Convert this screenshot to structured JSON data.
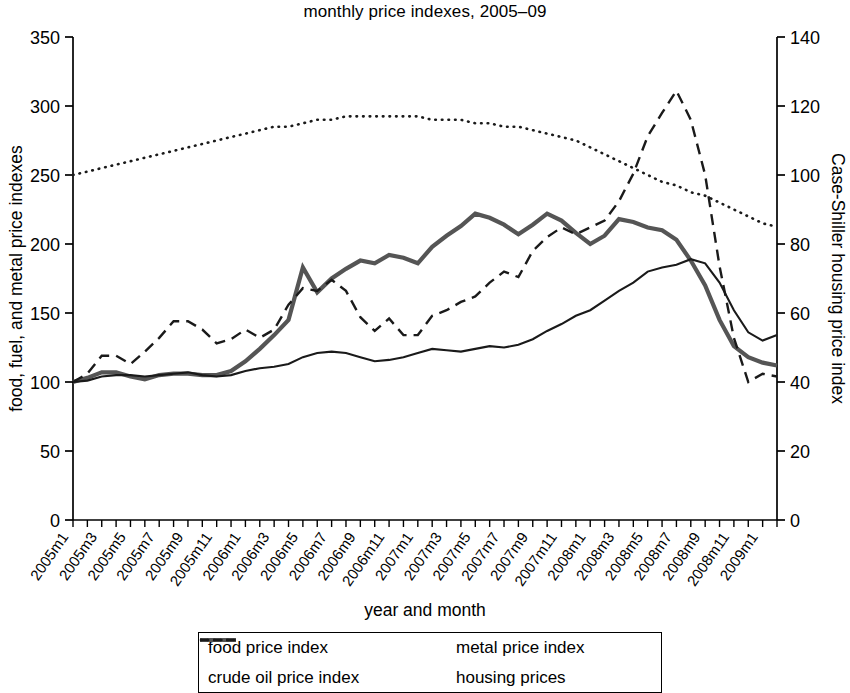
{
  "chart_data": {
    "type": "line",
    "title": "monthly price indexes, 2005–09",
    "xlabel": "year and month",
    "ylabel": "food, fuel, and metal price indexes",
    "y2label": "Case-Shiller housing price index",
    "ylim": [
      0,
      350
    ],
    "yticks": [
      0,
      50,
      100,
      150,
      200,
      250,
      300,
      350
    ],
    "y2lim": [
      0,
      140
    ],
    "y2ticks": [
      0,
      20,
      40,
      60,
      80,
      100,
      120,
      140
    ],
    "grid": false,
    "legend_position": "bottom",
    "x": [
      "2005m1",
      "2005m2",
      "2005m3",
      "2005m4",
      "2005m5",
      "2005m6",
      "2005m7",
      "2005m8",
      "2005m9",
      "2005m10",
      "2005m11",
      "2005m12",
      "2006m1",
      "2006m2",
      "2006m3",
      "2006m4",
      "2006m5",
      "2006m6",
      "2006m7",
      "2006m8",
      "2006m9",
      "2006m10",
      "2006m11",
      "2006m12",
      "2007m1",
      "2007m2",
      "2007m3",
      "2007m4",
      "2007m5",
      "2007m6",
      "2007m7",
      "2007m8",
      "2007m9",
      "2007m10",
      "2007m11",
      "2007m12",
      "2008m1",
      "2008m2",
      "2008m3",
      "2008m4",
      "2008m5",
      "2008m6",
      "2008m7",
      "2008m8",
      "2008m9",
      "2008m10",
      "2008m11",
      "2008m12",
      "2009m1",
      "2009m2"
    ],
    "xtick_labels": [
      "2005m1",
      "2005m3",
      "2005m5",
      "2005m7",
      "2005m9",
      "2005m11",
      "2006m1",
      "2006m3",
      "2006m5",
      "2006m7",
      "2006m9",
      "2006m11",
      "2007m1",
      "2007m3",
      "2007m5",
      "2007m7",
      "2007m9",
      "2007m11",
      "2008m1",
      "2008m3",
      "2008m5",
      "2008m7",
      "2008m9",
      "2008m11",
      "2009m1"
    ],
    "series": [
      {
        "name": "food price index",
        "axis": "left",
        "style": "solid",
        "values": [
          100,
          101,
          104,
          105,
          105,
          104,
          105,
          106,
          107,
          105,
          104,
          105,
          108,
          110,
          111,
          113,
          118,
          121,
          122,
          121,
          118,
          115,
          116,
          118,
          121,
          124,
          123,
          122,
          124,
          126,
          125,
          127,
          131,
          137,
          142,
          148,
          152,
          159,
          166,
          172,
          180,
          183,
          185,
          189,
          186,
          172,
          152,
          136,
          130,
          134
        ]
      },
      {
        "name": "metal price index",
        "axis": "left",
        "style": "solid-thick",
        "values": [
          100,
          103,
          107,
          107,
          104,
          102,
          105,
          106,
          106,
          105,
          105,
          108,
          115,
          124,
          134,
          145,
          183,
          165,
          175,
          182,
          188,
          186,
          192,
          190,
          186,
          198,
          206,
          213,
          222,
          219,
          214,
          207,
          214,
          222,
          217,
          208,
          200,
          206,
          218,
          216,
          212,
          210,
          203,
          188,
          170,
          145,
          126,
          118,
          114,
          112
        ]
      },
      {
        "name": "crude oil price index",
        "axis": "left",
        "style": "dashed",
        "values": [
          100,
          106,
          119,
          119,
          113,
          122,
          132,
          144,
          144,
          138,
          128,
          131,
          138,
          132,
          138,
          156,
          168,
          166,
          174,
          166,
          147,
          137,
          146,
          134,
          134,
          148,
          152,
          158,
          162,
          172,
          180,
          176,
          195,
          205,
          212,
          207,
          212,
          217,
          231,
          251,
          278,
          295,
          311,
          290,
          250,
          184,
          132,
          100,
          106,
          104
        ]
      },
      {
        "name": "housing prices",
        "axis": "right",
        "style": "dotted",
        "values": [
          100,
          101,
          102,
          103,
          104,
          105,
          106,
          107,
          108,
          109,
          110,
          111,
          112,
          113,
          114,
          114,
          115,
          116,
          116,
          117,
          117,
          117,
          117,
          117,
          117,
          116,
          116,
          116,
          115,
          115,
          114,
          114,
          113,
          112,
          111,
          110,
          108,
          106,
          104,
          102,
          100,
          98,
          97,
          95,
          94,
          92,
          90,
          88,
          86,
          85
        ],
        "values_display_note": "right axis, Case-Shiller index"
      }
    ]
  },
  "legend": {
    "items": [
      {
        "label": "food price index",
        "swatch": "solid-line"
      },
      {
        "label": "metal price index",
        "swatch": "thick-solid-line"
      },
      {
        "label": "crude oil price index",
        "swatch": "dashed-line"
      },
      {
        "label": "housing prices",
        "swatch": "dotted-line"
      }
    ]
  }
}
